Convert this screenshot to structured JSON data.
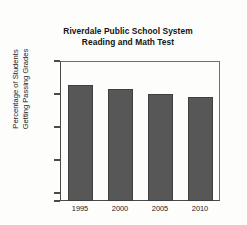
{
  "chart_data": {
    "type": "bar",
    "title": "Riverdale Public School System Reading and Math Test",
    "title_lines": [
      "Riverdale Public School System",
      "Reading and Math Test"
    ],
    "xlabel": "",
    "ylabel": "Percentage of Students Getting Passing Grades",
    "ylabel_lines": [
      "Percentage of Students",
      "Getting Passing Grades"
    ],
    "categories": [
      "1995",
      "2000",
      "2005",
      "2010"
    ],
    "values": [
      86.3,
      85.8,
      85.0,
      84.6
    ],
    "ylim": [
      68.8,
      90
    ],
    "yticks": [
      90,
      85,
      80,
      75,
      70
    ],
    "ytick_labels": [
      "90%",
      "85%",
      "80%",
      "75%",
      "70%"
    ],
    "baseline_label": "0",
    "axis_break": true,
    "grid": false,
    "legend": null,
    "bar_color": "#575757",
    "bar_edge_color": "#3f3f3f",
    "axis_color": "#4a4a4a",
    "background_color": "#fdfdfc"
  }
}
